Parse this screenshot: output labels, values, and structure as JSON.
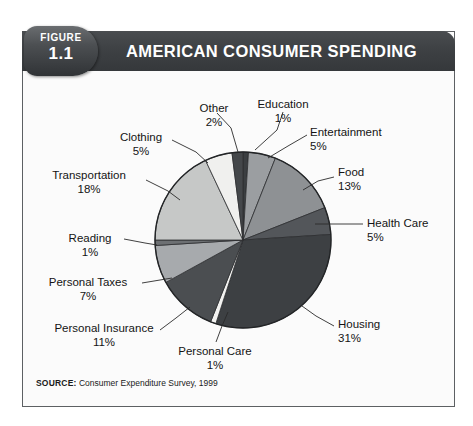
{
  "figure": {
    "badge_word": "FIGURE",
    "badge_number": "1.1",
    "title": "AMERICAN CONSUMER SPENDING",
    "source_key": "SOURCE:",
    "source_value": " Consumer Expenditure Survey, 1999"
  },
  "colors": {
    "header_bar": "#3e4144",
    "badge": "#4c4f52",
    "frame_border": "#5d6063",
    "page_background": "#ffffff",
    "figure_background": "#fbfbfb",
    "text": "#141414"
  },
  "chart_data": {
    "type": "pie",
    "title": "AMERICAN CONSUMER SPENDING",
    "source": "SOURCE: Consumer Expenditure Survey, 1999",
    "units": "percent of total consumer spending",
    "total": 100,
    "start_angle_deg": -90,
    "direction": "clockwise",
    "grid": false,
    "legend": "callout-labels",
    "categories": [
      "Education",
      "Entertainment",
      "Food",
      "Health Care",
      "Housing",
      "Personal Care",
      "Personal Insurance",
      "Personal Taxes",
      "Reading",
      "Transportation",
      "Clothing",
      "Other"
    ],
    "values": [
      1,
      5,
      13,
      5,
      31,
      1,
      11,
      7,
      1,
      18,
      5,
      2
    ],
    "slices": [
      {
        "label": "Education",
        "value": 1,
        "pct_text": "1%",
        "color": "#3b3e41"
      },
      {
        "label": "Entertainment",
        "value": 5,
        "pct_text": "5%",
        "color": "#9b9ea1"
      },
      {
        "label": "Food",
        "value": 13,
        "pct_text": "13%",
        "color": "#8e9194"
      },
      {
        "label": "Health Care",
        "value": 5,
        "pct_text": "5%",
        "color": "#53565a"
      },
      {
        "label": "Housing",
        "value": 31,
        "pct_text": "31%",
        "color": "#3d4043"
      },
      {
        "label": "Personal Care",
        "value": 1,
        "pct_text": "1%",
        "color": "#f2f2f0"
      },
      {
        "label": "Personal Insurance",
        "value": 11,
        "pct_text": "11%",
        "color": "#4b4e51"
      },
      {
        "label": "Personal Taxes",
        "value": 7,
        "pct_text": "7%",
        "color": "#a7aaad"
      },
      {
        "label": "Reading",
        "value": 1,
        "pct_text": "1%",
        "color": "#6d7073"
      },
      {
        "label": "Transportation",
        "value": 18,
        "pct_text": "18%",
        "color": "#c6c8c7"
      },
      {
        "label": "Clothing",
        "value": 5,
        "pct_text": "5%",
        "color": "#f0f0ee"
      },
      {
        "label": "Other",
        "value": 2,
        "pct_text": "2%",
        "color": "#44474a"
      }
    ]
  },
  "labels": {
    "other": {
      "name": "Other",
      "pct": "2%"
    },
    "education": {
      "name": "Education",
      "pct": "1%"
    },
    "entertainment": {
      "name": "Entertainment",
      "pct": "5%"
    },
    "food": {
      "name": "Food",
      "pct": "13%"
    },
    "health_care": {
      "name": "Health Care",
      "pct": "5%"
    },
    "housing": {
      "name": "Housing",
      "pct": "31%"
    },
    "personal_care": {
      "name": "Personal Care",
      "pct": "1%"
    },
    "personal_insurance": {
      "name": "Personal Insurance",
      "pct": "11%"
    },
    "personal_taxes": {
      "name": "Personal Taxes",
      "pct": "7%"
    },
    "reading": {
      "name": "Reading",
      "pct": "1%"
    },
    "transportation": {
      "name": "Transportation",
      "pct": "18%"
    },
    "clothing": {
      "name": "Clothing",
      "pct": "5%"
    }
  }
}
